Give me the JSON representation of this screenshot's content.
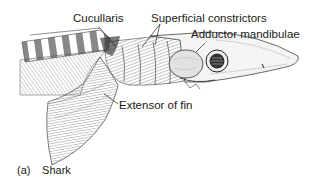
{
  "figure": {
    "labels": {
      "cucullaris": "Cucullaris",
      "superficial_constrictors": "Superficial constrictors",
      "adductor_mandibulae": "Adductor mandibulae",
      "extensor_of_fin": "Extensor of fin"
    },
    "caption": {
      "tag": "(a)",
      "text": "Shark"
    }
  }
}
